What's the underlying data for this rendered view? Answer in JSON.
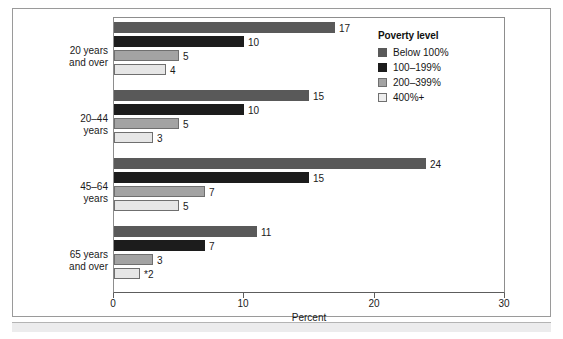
{
  "chart_data": {
    "type": "bar",
    "orientation": "horizontal",
    "title": "",
    "xlabel": "Percent",
    "ylabel": "",
    "xlim": [
      0,
      30
    ],
    "xticks": [
      "0",
      "10",
      "20",
      "30"
    ],
    "grid": false,
    "legend_position": "top-right",
    "legend_title": "Poverty level",
    "categories": [
      "20 years and over",
      "20–44 years",
      "45–64 years",
      "65 years and over"
    ],
    "category_lines": [
      [
        "20 years",
        "and over"
      ],
      [
        "20–44",
        "years"
      ],
      [
        "45–64",
        "years"
      ],
      [
        "65 years",
        "and over"
      ]
    ],
    "series": [
      {
        "name": "Below 100%",
        "color": "#595959",
        "values": [
          17,
          15,
          24,
          11
        ],
        "labels": [
          "17",
          "15",
          "24",
          "11"
        ]
      },
      {
        "name": "100–199%",
        "color": "#1c1c1c",
        "values": [
          10,
          10,
          15,
          7
        ],
        "labels": [
          "10",
          "10",
          "15",
          "7"
        ]
      },
      {
        "name": "200–399%",
        "color": "#a3a3a3",
        "values": [
          5,
          5,
          7,
          3
        ],
        "labels": [
          "5",
          "5",
          "7",
          "3"
        ]
      },
      {
        "name": "400%+",
        "color": "#e6e6e6",
        "values": [
          4,
          3,
          5,
          2
        ],
        "labels": [
          "4",
          "3",
          "5",
          "*2"
        ]
      }
    ],
    "annotations": [
      "* indicates estimate with relative standard error noted"
    ]
  },
  "axis": {
    "x_title": "Percent",
    "ticks": [
      {
        "value": 0,
        "label": "0"
      },
      {
        "value": 10,
        "label": "10"
      },
      {
        "value": 20,
        "label": "20"
      },
      {
        "value": 30,
        "label": "30"
      }
    ]
  },
  "legend": {
    "title": "Poverty level",
    "items": [
      {
        "label": "Below 100%",
        "color": "#595959"
      },
      {
        "label": "100–199%",
        "color": "#1c1c1c"
      },
      {
        "label": "200–399%",
        "color": "#a3a3a3"
      },
      {
        "label": "400%+",
        "color": "#e6e6e6"
      }
    ]
  }
}
